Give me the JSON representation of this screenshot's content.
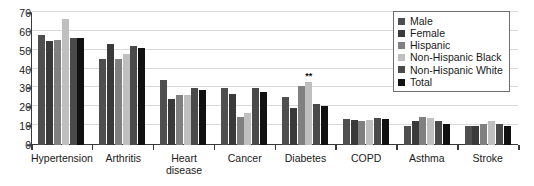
{
  "chart_data": {
    "type": "bar",
    "title": "",
    "xlabel": "",
    "ylabel": "",
    "ylim": [
      0,
      70
    ],
    "ytick_step": 10,
    "yticks": [
      70,
      60,
      50,
      40,
      30,
      20,
      10,
      0
    ],
    "grid": true,
    "legend_position": "top-right",
    "categories": [
      "Hypertension",
      "Arthritis",
      "Heart\ndisease",
      "Cancer",
      "Diabetes",
      "COPD",
      "Asthma",
      "Stroke"
    ],
    "series": [
      {
        "name": "Male",
        "color": "#4f4f4f",
        "values": [
          58.5,
          45.5,
          34.5,
          30.0,
          25.5,
          14.0,
          10.0,
          10.0
        ]
      },
      {
        "name": "Female",
        "color": "#3a3a3a",
        "values": [
          55.0,
          53.5,
          24.5,
          27.0,
          19.5,
          13.5,
          12.5,
          10.0
        ]
      },
      {
        "name": "Hispanic",
        "color": "#808080",
        "values": [
          55.5,
          45.5,
          26.5,
          15.0,
          31.5,
          13.0,
          15.0,
          11.0
        ]
      },
      {
        "name": "Non-Hispanic Black",
        "color": "#bfbfbf",
        "values": [
          67.0,
          48.5,
          26.5,
          17.0,
          33.5,
          13.5,
          14.5,
          13.0
        ]
      },
      {
        "name": "Non-Hispanic White",
        "color": "#4a4a4a",
        "values": [
          56.5,
          52.5,
          30.0,
          30.0,
          22.0,
          14.5,
          13.0,
          11.0
        ]
      },
      {
        "name": "Total",
        "color": "#111111",
        "values": [
          57.0,
          51.5,
          29.0,
          28.0,
          20.5,
          14.0,
          11.0,
          10.0
        ]
      }
    ],
    "annotations": [
      {
        "category": "Diabetes",
        "series": "Non-Hispanic Black",
        "text": "**"
      }
    ]
  },
  "legend": {
    "items": [
      {
        "label": "Male"
      },
      {
        "label": "Female"
      },
      {
        "label": "Hispanic"
      },
      {
        "label": "Non-Hispanic Black"
      },
      {
        "label": "Non-Hispanic White"
      },
      {
        "label": "Total"
      }
    ]
  }
}
